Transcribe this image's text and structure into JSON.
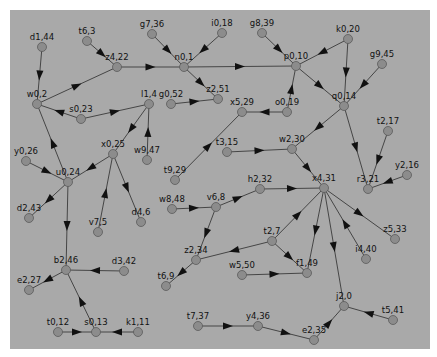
{
  "diagram": {
    "type": "directed-graph",
    "background": "#a9a9a9",
    "node_fill": "#8c8c8c",
    "edge_color": "#3a3a3a",
    "nodes": [
      {
        "id": "d1,44",
        "x": 42,
        "y": 47
      },
      {
        "id": "t6,3",
        "x": 87,
        "y": 41
      },
      {
        "id": "z4,22",
        "x": 117,
        "y": 67
      },
      {
        "id": "g7,36",
        "x": 152,
        "y": 34
      },
      {
        "id": "i0,18",
        "x": 222,
        "y": 33
      },
      {
        "id": "n0,1",
        "x": 184,
        "y": 67
      },
      {
        "id": "g8,39",
        "x": 262,
        "y": 33
      },
      {
        "id": "k0,20",
        "x": 348,
        "y": 39
      },
      {
        "id": "p0,10",
        "x": 296,
        "y": 66
      },
      {
        "id": "g9,45",
        "x": 382,
        "y": 64
      },
      {
        "id": "w0,2",
        "x": 37,
        "y": 104
      },
      {
        "id": "s0,23",
        "x": 81,
        "y": 119
      },
      {
        "id": "l1,4",
        "x": 149,
        "y": 104
      },
      {
        "id": "z2,51",
        "x": 218,
        "y": 99
      },
      {
        "id": "g0,52",
        "x": 171,
        "y": 104
      },
      {
        "id": "x5,29",
        "x": 242,
        "y": 112
      },
      {
        "id": "o0,19",
        "x": 287,
        "y": 112
      },
      {
        "id": "q0,14",
        "x": 344,
        "y": 106
      },
      {
        "id": "t2,17",
        "x": 388,
        "y": 131
      },
      {
        "id": "y0,26",
        "x": 26,
        "y": 161
      },
      {
        "id": "x0,25",
        "x": 113,
        "y": 154
      },
      {
        "id": "w9,47",
        "x": 147,
        "y": 160
      },
      {
        "id": "t9,29",
        "x": 175,
        "y": 180
      },
      {
        "id": "t3,15",
        "x": 227,
        "y": 152
      },
      {
        "id": "w2,30",
        "x": 292,
        "y": 149
      },
      {
        "id": "y2,16",
        "x": 407,
        "y": 175
      },
      {
        "id": "u0,24",
        "x": 68,
        "y": 182
      },
      {
        "id": "r3,21",
        "x": 368,
        "y": 189
      },
      {
        "id": "h2,32",
        "x": 260,
        "y": 189
      },
      {
        "id": "x4,31",
        "x": 324,
        "y": 188
      },
      {
        "id": "w8,48",
        "x": 172,
        "y": 209
      },
      {
        "id": "v6,8",
        "x": 216,
        "y": 207
      },
      {
        "id": "d2,43",
        "x": 29,
        "y": 218
      },
      {
        "id": "v7,5",
        "x": 98,
        "y": 232
      },
      {
        "id": "d4,6",
        "x": 141,
        "y": 222
      },
      {
        "id": "z5,33",
        "x": 395,
        "y": 239
      },
      {
        "id": "i4,40",
        "x": 366,
        "y": 259
      },
      {
        "id": "t2,7",
        "x": 272,
        "y": 241
      },
      {
        "id": "z2,34",
        "x": 196,
        "y": 260
      },
      {
        "id": "w5,50",
        "x": 242,
        "y": 275
      },
      {
        "id": "f1,49",
        "x": 307,
        "y": 273
      },
      {
        "id": "t6,9",
        "x": 166,
        "y": 286
      },
      {
        "id": "b2,46",
        "x": 66,
        "y": 270
      },
      {
        "id": "d3,42",
        "x": 124,
        "y": 271
      },
      {
        "id": "e2,27",
        "x": 29,
        "y": 290
      },
      {
        "id": "j2,0",
        "x": 344,
        "y": 306
      },
      {
        "id": "t5,41",
        "x": 393,
        "y": 320
      },
      {
        "id": "t7,37",
        "x": 198,
        "y": 326
      },
      {
        "id": "y4,36",
        "x": 258,
        "y": 326
      },
      {
        "id": "e2,35",
        "x": 314,
        "y": 340
      },
      {
        "id": "t0,12",
        "x": 58,
        "y": 332
      },
      {
        "id": "s0,13",
        "x": 96,
        "y": 332
      },
      {
        "id": "k1,11",
        "x": 138,
        "y": 332
      }
    ],
    "edges": [
      {
        "from": "d1,44",
        "to": "w0,2"
      },
      {
        "from": "t6,3",
        "to": "z4,22"
      },
      {
        "from": "w0,2",
        "to": "z4,22"
      },
      {
        "from": "z4,22",
        "to": "n0,1"
      },
      {
        "from": "g7,36",
        "to": "n0,1"
      },
      {
        "from": "i0,18",
        "to": "n0,1"
      },
      {
        "from": "n0,1",
        "to": "p0,10"
      },
      {
        "from": "n0,1",
        "to": "z2,51"
      },
      {
        "from": "g8,39",
        "to": "p0,10"
      },
      {
        "from": "k0,20",
        "to": "p0,10"
      },
      {
        "from": "k0,20",
        "to": "q0,14"
      },
      {
        "from": "p0,10",
        "to": "q0,14"
      },
      {
        "from": "g9,45",
        "to": "q0,14"
      },
      {
        "from": "o0,19",
        "to": "p0,10"
      },
      {
        "from": "o0,19",
        "to": "x5,29"
      },
      {
        "from": "g0,52",
        "to": "z2,51"
      },
      {
        "from": "s0,23",
        "to": "w0,2"
      },
      {
        "from": "s0,23",
        "to": "l1,4"
      },
      {
        "from": "l1,4",
        "to": "x0,25"
      },
      {
        "from": "w9,47",
        "to": "l1,4"
      },
      {
        "from": "t9,29",
        "to": "x5,29"
      },
      {
        "from": "q0,14",
        "to": "w2,30"
      },
      {
        "from": "q0,14",
        "to": "r3,21"
      },
      {
        "from": "t2,17",
        "to": "r3,21"
      },
      {
        "from": "y2,16",
        "to": "r3,21"
      },
      {
        "from": "t3,15",
        "to": "w2,30"
      },
      {
        "from": "w2,30",
        "to": "x4,31"
      },
      {
        "from": "u0,24",
        "to": "w0,2"
      },
      {
        "from": "y0,26",
        "to": "u0,24"
      },
      {
        "from": "x0,25",
        "to": "u0,24"
      },
      {
        "from": "u0,24",
        "to": "d2,43"
      },
      {
        "from": "u0,24",
        "to": "b2,46"
      },
      {
        "from": "v7,5",
        "to": "x0,25"
      },
      {
        "from": "x0,25",
        "to": "d4,6"
      },
      {
        "from": "h2,32",
        "to": "x4,31"
      },
      {
        "from": "v6,8",
        "to": "h2,32"
      },
      {
        "from": "w8,48",
        "to": "v6,8"
      },
      {
        "from": "v6,8",
        "to": "z2,34"
      },
      {
        "from": "x4,31",
        "to": "z5,33"
      },
      {
        "from": "i4,40",
        "to": "x4,31"
      },
      {
        "from": "x4,31",
        "to": "f1,49"
      },
      {
        "from": "x4,31",
        "to": "j2,0"
      },
      {
        "from": "t2,7",
        "to": "x4,31"
      },
      {
        "from": "t2,7",
        "to": "z2,34"
      },
      {
        "from": "t2,7",
        "to": "f1,49"
      },
      {
        "from": "w5,50",
        "to": "f1,49"
      },
      {
        "from": "z2,34",
        "to": "t6,9"
      },
      {
        "from": "d3,42",
        "to": "b2,46"
      },
      {
        "from": "b2,46",
        "to": "e2,27"
      },
      {
        "from": "s0,13",
        "to": "b2,46"
      },
      {
        "from": "t0,12",
        "to": "s0,13"
      },
      {
        "from": "k1,11",
        "to": "s0,13"
      },
      {
        "from": "t5,41",
        "to": "j2,0"
      },
      {
        "from": "e2,35",
        "to": "j2,0"
      },
      {
        "from": "y4,36",
        "to": "e2,35"
      },
      {
        "from": "t7,37",
        "to": "y4,36"
      }
    ]
  }
}
